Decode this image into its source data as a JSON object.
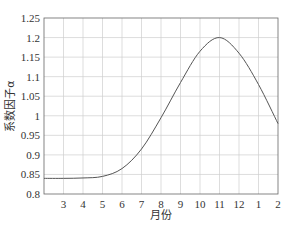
{
  "chart_data": {
    "type": "line",
    "title": "",
    "xlabel": "月份",
    "ylabel": "系数因子α",
    "x_tick_labels": [
      "3",
      "4",
      "5",
      "6",
      "7",
      "8",
      "9",
      "10",
      "11",
      "12",
      "1",
      "2"
    ],
    "y_tick_labels": [
      "0.8",
      "0.85",
      "0.9",
      "0.95",
      "1",
      "1.05",
      "1.1",
      "1.15",
      "1.2",
      "1.25"
    ],
    "ylim": [
      0.8,
      1.25
    ],
    "grid": true,
    "legend": null,
    "series": [
      {
        "name": "系数因子α",
        "x": [
          "2",
          "3",
          "4",
          "5",
          "6",
          "7",
          "8",
          "9",
          "10",
          "11",
          "12",
          "1",
          "2"
        ],
        "values": [
          0.84,
          0.84,
          0.841,
          0.845,
          0.865,
          0.915,
          0.995,
          1.085,
          1.165,
          1.2,
          1.16,
          1.08,
          0.98
        ]
      }
    ]
  },
  "colors": {
    "line": "#555555",
    "grid": "#cfcfcf",
    "frame": "#666666"
  }
}
